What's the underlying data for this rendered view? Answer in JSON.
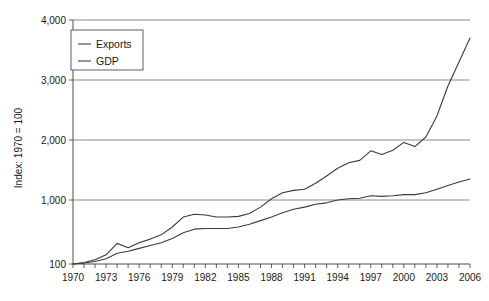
{
  "chart_data": {
    "type": "line",
    "title": "",
    "subtitle": "",
    "xlabel": "",
    "ylabel": "Index: 1970 = 100",
    "grid": "horizontal",
    "legend_position": "top-left",
    "xlim": [
      1970,
      2006
    ],
    "ylim": [
      100,
      4000
    ],
    "y_ticks": [
      100,
      1000,
      2000,
      3000,
      4000
    ],
    "y_tick_labels": [
      "100",
      "1,000",
      "2,000",
      "3,000",
      "4,000"
    ],
    "y_scale_note": "100 baseline then linear 1,000-4,000",
    "x_ticks": [
      1970,
      1971,
      1972,
      1973,
      1974,
      1975,
      1976,
      1977,
      1978,
      1979,
      1980,
      1981,
      1982,
      1983,
      1984,
      1985,
      1986,
      1987,
      1988,
      1989,
      1990,
      1991,
      1992,
      1993,
      1994,
      1995,
      1996,
      1997,
      1998,
      1999,
      2000,
      2001,
      2002,
      2003,
      2004,
      2005,
      2006
    ],
    "x_tick_labels": [
      "1970",
      "1973",
      "1976",
      "1979",
      "1982",
      "1985",
      "1988",
      "1991",
      "1994",
      "1997",
      "2000",
      "2003",
      "2006"
    ],
    "x_label_years": [
      1970,
      1973,
      1976,
      1979,
      1982,
      1985,
      1988,
      1991,
      1994,
      1997,
      2000,
      2003,
      2006
    ],
    "x": [
      1970,
      1971,
      1972,
      1973,
      1974,
      1975,
      1976,
      1977,
      1978,
      1979,
      1980,
      1981,
      1982,
      1983,
      1984,
      1985,
      1986,
      1987,
      1988,
      1989,
      1990,
      1991,
      1992,
      1993,
      1994,
      1995,
      1996,
      1997,
      1998,
      1999,
      2000,
      2001,
      2002,
      2003,
      2004,
      2005,
      2006
    ],
    "series": [
      {
        "name": "Exports",
        "color": "#3b3b3b",
        "values": [
          100,
          120,
          160,
          230,
          390,
          330,
          400,
          450,
          510,
          620,
          760,
          800,
          790,
          760,
          760,
          770,
          810,
          900,
          1020,
          1120,
          1160,
          1180,
          1280,
          1400,
          1530,
          1620,
          1660,
          1820,
          1760,
          1830,
          1960,
          1890,
          2050,
          2400,
          2900,
          3300,
          3700
        ]
      },
      {
        "name": "GDP",
        "color": "#3b3b3b",
        "values": [
          100,
          115,
          135,
          175,
          250,
          280,
          320,
          360,
          400,
          460,
          540,
          590,
          600,
          600,
          600,
          620,
          660,
          710,
          760,
          820,
          870,
          900,
          940,
          960,
          1000,
          1020,
          1030,
          1070,
          1060,
          1070,
          1090,
          1090,
          1120,
          1180,
          1240,
          1300,
          1350
        ]
      }
    ],
    "legend_entries": [
      {
        "label": "Exports"
      },
      {
        "label": "GDP"
      }
    ]
  }
}
